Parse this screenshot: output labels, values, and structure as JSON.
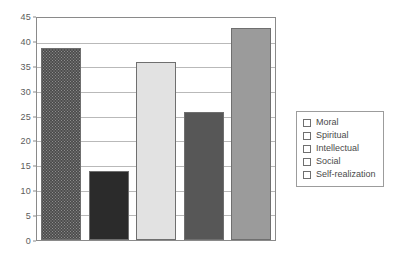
{
  "chart_data": {
    "type": "bar",
    "title": "",
    "subtitle": "",
    "xlabel": "",
    "ylabel": "",
    "categories": [
      "Moral",
      "Spiritual",
      "Intellectual",
      "Social",
      "Self-realization"
    ],
    "values": [
      39,
      14,
      36,
      26,
      43
    ],
    "ylim": [
      0,
      45
    ],
    "ytick_step": 5,
    "yticks": [
      "0",
      "5",
      "10",
      "15",
      "20",
      "25",
      "30",
      "35",
      "40",
      "45"
    ],
    "grid": true,
    "grid_axis": "y",
    "legend_position": "right-outside",
    "series": [
      {
        "name": "Moral",
        "value": 39,
        "color": "#8d8d8d",
        "fill": "checkered-hatch"
      },
      {
        "name": "Spiritual",
        "value": 14,
        "color": "#2b2b2b",
        "fill": "solid"
      },
      {
        "name": "Intellectual",
        "value": 36,
        "color": "#e2e2e2",
        "fill": "solid"
      },
      {
        "name": "Social",
        "value": 26,
        "color": "#575757",
        "fill": "solid"
      },
      {
        "name": "Self-realization",
        "value": 43,
        "color": "#9b9b9b",
        "fill": "solid"
      }
    ]
  },
  "colors": {
    "background": "#ffffff",
    "plot_border": "#8a8a8a",
    "gridline": "#b9b9b9",
    "axis_text": "#5b5b5b",
    "legend_border": "#9c9c9c",
    "legend_text": "#4a4a4a",
    "bar_border": "#6f6f6f"
  },
  "legend": {
    "items": [
      {
        "label": "Moral"
      },
      {
        "label": "Spiritual"
      },
      {
        "label": "Intellectual"
      },
      {
        "label": "Social"
      },
      {
        "label": "Self-realization"
      }
    ]
  }
}
